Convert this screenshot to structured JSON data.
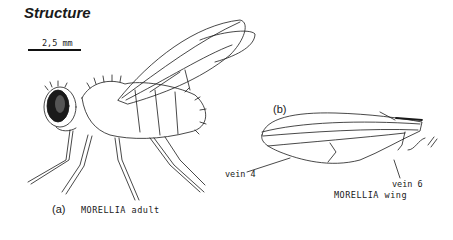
{
  "title": "Structure",
  "scale": {
    "label": "2,5 mm"
  },
  "figure_a": {
    "panel": "(a)",
    "caption": "MORELLIA adult"
  },
  "figure_b": {
    "panel": "(b)",
    "caption": "MORELLIA wing",
    "labels": {
      "vein4": "vein 4",
      "vein6": "vein 6"
    }
  },
  "colors": {
    "ink": "#1a1a1a",
    "background": "#ffffff"
  }
}
